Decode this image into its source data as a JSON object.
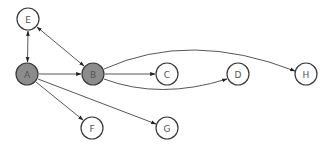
{
  "diagram": {
    "type": "directed-graph",
    "node_radius": 11,
    "colors": {
      "highlight_fill": "#8c8c8c",
      "default_fill": "#ffffff",
      "stroke": "#3a3a3a",
      "edge": "#444444"
    },
    "nodes": [
      {
        "id": "E",
        "label": "E",
        "x": 28,
        "y": 19,
        "highlighted": false
      },
      {
        "id": "A",
        "label": "A",
        "x": 27,
        "y": 74,
        "highlighted": true
      },
      {
        "id": "B",
        "label": "B",
        "x": 93,
        "y": 74,
        "highlighted": true
      },
      {
        "id": "C",
        "label": "C",
        "x": 167,
        "y": 74,
        "highlighted": false
      },
      {
        "id": "D",
        "label": "D",
        "x": 238,
        "y": 74,
        "highlighted": false
      },
      {
        "id": "H",
        "label": "H",
        "x": 306,
        "y": 74,
        "highlighted": false
      },
      {
        "id": "F",
        "label": "F",
        "x": 92,
        "y": 128,
        "highlighted": false
      },
      {
        "id": "G",
        "label": "G",
        "x": 167,
        "y": 128,
        "highlighted": false
      }
    ],
    "edges": [
      {
        "from": "E",
        "to": "A",
        "bidirectional": true
      },
      {
        "from": "E",
        "to": "B",
        "bidirectional": true
      },
      {
        "from": "A",
        "to": "B",
        "bidirectional": false
      },
      {
        "from": "A",
        "to": "F",
        "bidirectional": false
      },
      {
        "from": "A",
        "to": "D",
        "bidirectional": false,
        "curved": true
      },
      {
        "from": "B",
        "to": "C",
        "bidirectional": false
      },
      {
        "from": "B",
        "to": "H",
        "bidirectional": false,
        "curved": true
      },
      {
        "from": "B",
        "to": "G",
        "bidirectional": false
      }
    ]
  }
}
